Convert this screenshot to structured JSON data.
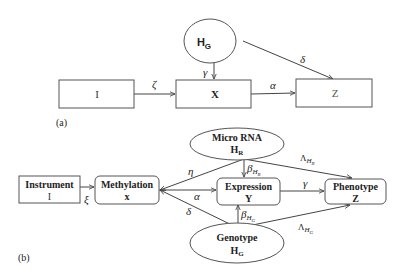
{
  "panel_a": {
    "label": "(a)",
    "nodes": {
      "hg": {
        "main": "H",
        "sub": "G"
      },
      "i": {
        "text": "I"
      },
      "x": {
        "text": "X"
      },
      "z": {
        "text": "Z"
      }
    },
    "edges": {
      "i_x": "ζ",
      "hg_x": "γ",
      "x_z": "α",
      "hg_z": "δ"
    }
  },
  "panel_b": {
    "label": "(b)",
    "nodes": {
      "instrument": {
        "title": "Instrument",
        "symbol": "I"
      },
      "methylation": {
        "title": "Methylation",
        "symbol": "x"
      },
      "expression": {
        "title": "Expression",
        "symbol": "Y"
      },
      "phenotype": {
        "title": "Phenotype",
        "symbol": "Z"
      },
      "microrna": {
        "title": "Micro RNA",
        "symbol": "H",
        "sub": "R"
      },
      "genotype": {
        "title": "Genotype",
        "symbol": "H",
        "sub": "G"
      }
    },
    "edges": {
      "instrument_methylation": "ξ",
      "methylation_microrna": "η",
      "methylation_expression": "α",
      "methylation_genotype": "δ",
      "microrna_expression": {
        "main": "β",
        "sub": "H",
        "subsub": "R"
      },
      "genotype_expression": {
        "main": "β",
        "sub": "H",
        "subsub": "G"
      },
      "expression_phenotype": "γ",
      "microrna_phenotype": {
        "main": "Λ",
        "sub": "H",
        "subsub": "R"
      },
      "genotype_phenotype": {
        "main": "Λ",
        "sub": "H",
        "subsub": "G"
      }
    }
  }
}
